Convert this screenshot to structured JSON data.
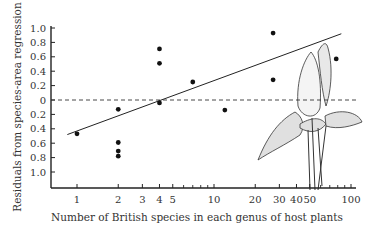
{
  "chart_data": {
    "type": "scatter",
    "title": "",
    "xlabel": "Number of British species in each genus of host plants",
    "ylabel": "Residuals from species-area regression",
    "x_scale": "log",
    "x_ticks": [
      1,
      2,
      3,
      4,
      5,
      10,
      20,
      30,
      40,
      50,
      100
    ],
    "x_tick_labels": [
      "1",
      "2",
      "3",
      "4",
      "5",
      "10",
      "20",
      "30",
      "40",
      "50",
      "100"
    ],
    "y_ticks": [
      1.0,
      0.8,
      0.6,
      0.4,
      0.2,
      0,
      -0.2,
      -0.4,
      -0.6,
      -0.8,
      -1.0
    ],
    "y_tick_labels": [
      "1.0",
      "0.8",
      "0.6",
      "0.4",
      "0.2",
      "0",
      "0.2",
      "0.4",
      "0.6",
      "0.8",
      "1.0"
    ],
    "ylim": [
      -1.1,
      1.0
    ],
    "xlim": [
      0.8,
      110
    ],
    "grid": false,
    "points": [
      {
        "x": 1,
        "y": -0.47
      },
      {
        "x": 2,
        "y": -0.13
      },
      {
        "x": 2,
        "y": -0.59
      },
      {
        "x": 2,
        "y": -0.71
      },
      {
        "x": 2,
        "y": -0.78
      },
      {
        "x": 4,
        "y": 0.71
      },
      {
        "x": 4,
        "y": 0.51
      },
      {
        "x": 4,
        "y": -0.04
      },
      {
        "x": 7,
        "y": 0.25
      },
      {
        "x": 12,
        "y": -0.14
      },
      {
        "x": 27,
        "y": 0.93
      },
      {
        "x": 27,
        "y": 0.28
      },
      {
        "x": 78,
        "y": 0.57
      }
    ],
    "regression_line": {
      "x": [
        0.85,
        85
      ],
      "y": [
        -0.48,
        0.92
      ]
    },
    "reference_line": {
      "y": 0,
      "style": "dashed"
    },
    "annotations": [
      "Illustration of host plant (arum-like leaves and spathe)"
    ]
  }
}
